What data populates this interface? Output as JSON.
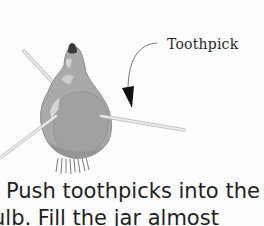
{
  "illustration": {
    "subject": "bulb-with-toothpicks",
    "callout": {
      "label": "Toothpick",
      "arrow": "curved-arrow-down"
    },
    "colors": {
      "bulb": "#a9a9a9",
      "bulb_shadow": "#8d8d8d",
      "bulb_highlight": "#d9d9d9",
      "tip": "#3a3a3a",
      "toothpick": "#e6e6e6",
      "toothpick_edge": "#b8b8b8",
      "arrow": "#1a1a1a",
      "text": "#1f1f1f"
    }
  },
  "instructions": {
    "line1": "Push toothpicks into the",
    "line2": "ulb. Fill the jar almost"
  }
}
